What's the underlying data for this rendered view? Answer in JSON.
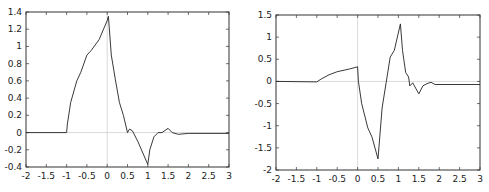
{
  "chart_data": [
    {
      "type": "line",
      "title": "",
      "xlabel": "",
      "ylabel": "",
      "xlim": [
        -2,
        3
      ],
      "ylim": [
        -0.4,
        1.4
      ],
      "grid": false,
      "legend": null,
      "xticks": [
        -2,
        -1.5,
        -1,
        -0.5,
        0,
        0.5,
        1,
        1.5,
        2,
        2.5,
        3
      ],
      "xtick_labels": [
        "-2",
        "-1.5",
        "-1",
        "-0.5",
        "0",
        "0.5",
        "1",
        "1.5",
        "2",
        "2.5",
        "3"
      ],
      "yticks": [
        -0.4,
        -0.2,
        0,
        0.2,
        0.4,
        0.6,
        0.8,
        1,
        1.2,
        1.4
      ],
      "ytick_labels": [
        "-0.4",
        "-0.2",
        "0",
        "0.2",
        "0.4",
        "0.6",
        "0.8",
        "1",
        "1.2",
        "1.4"
      ],
      "zero_lines": true,
      "series": [
        {
          "name": "",
          "x": [
            -2,
            -1,
            -0.98,
            -0.9,
            -0.75,
            -0.65,
            -0.5,
            -0.4,
            -0.2,
            0,
            0.03,
            0.1,
            0.2,
            0.3,
            0.4,
            0.5,
            0.55,
            0.62,
            0.75,
            1.0,
            1.05,
            1.15,
            1.25,
            1.35,
            1.5,
            1.6,
            1.75,
            2.0,
            3.0
          ],
          "y": [
            0,
            0,
            0.1,
            0.35,
            0.6,
            0.7,
            0.9,
            0.95,
            1.08,
            1.3,
            1.35,
            0.9,
            0.62,
            0.35,
            0.2,
            0,
            0.04,
            0.02,
            -0.1,
            -0.37,
            -0.2,
            -0.05,
            0.0,
            0.0,
            0.05,
            0.0,
            -0.02,
            -0.01,
            -0.01
          ]
        }
      ]
    },
    {
      "type": "line",
      "title": "",
      "xlabel": "",
      "ylabel": "",
      "xlim": [
        -2,
        3
      ],
      "ylim": [
        -2,
        1.5
      ],
      "grid": false,
      "legend": null,
      "xticks": [
        -2,
        -1.5,
        -1,
        -0.5,
        0,
        0.5,
        1,
        1.5,
        2,
        2.5,
        3
      ],
      "xtick_labels": [
        "-2",
        "-1.5",
        "-1",
        "-0.5",
        "0",
        "0.5",
        "1",
        "1.5",
        "2",
        "2.5",
        "3"
      ],
      "yticks": [
        -2,
        -1.5,
        -1,
        -0.5,
        0,
        0.5,
        1,
        1.5
      ],
      "ytick_labels": [
        "-2",
        "-1.5",
        "-1",
        "-0.5",
        "0",
        "0.5",
        "1",
        "1.5"
      ],
      "zero_lines": true,
      "series": [
        {
          "name": "",
          "x": [
            -2,
            -1,
            -0.9,
            -0.7,
            -0.5,
            -0.2,
            0,
            0.02,
            0.1,
            0.25,
            0.35,
            0.5,
            0.6,
            0.7,
            0.8,
            0.9,
            1.05,
            1.1,
            1.18,
            1.25,
            1.28,
            1.35,
            1.5,
            1.6,
            1.7,
            1.8,
            1.9,
            3.0
          ],
          "y": [
            0,
            -0.01,
            0.05,
            0.15,
            0.22,
            0.28,
            0.33,
            0,
            -0.5,
            -1.05,
            -1.25,
            -1.75,
            -0.6,
            -0.02,
            0.55,
            0.7,
            1.3,
            0.7,
            0.2,
            0.1,
            -0.1,
            -0.03,
            -0.28,
            -0.1,
            -0.05,
            -0.02,
            -0.07,
            -0.07
          ]
        }
      ]
    }
  ],
  "colors": {
    "frame": "#333333",
    "curve": "#222222",
    "zero_line": "#d0d0d0",
    "text": "#222222"
  },
  "layout": {
    "plots": [
      {
        "left": 26,
        "right": 229,
        "top": 12,
        "bottom": 167
      },
      {
        "left": 276,
        "right": 480,
        "top": 15,
        "bottom": 170
      }
    ]
  }
}
